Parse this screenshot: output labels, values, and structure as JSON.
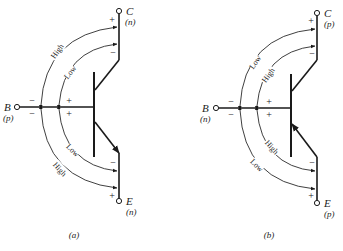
{
  "diagrams": [
    {
      "id": "a",
      "caption": "(a)",
      "type": "npn",
      "terminals": {
        "collector": {
          "letter": "C",
          "type": "(n)"
        },
        "base": {
          "letter": "B",
          "type": "(p)"
        },
        "emitter": {
          "letter": "E",
          "type": "(n)"
        }
      },
      "arcs": {
        "top_outer": "High",
        "top_inner": "Low",
        "bottom_inner": "Low",
        "bottom_outer": "High"
      },
      "signs": {
        "collector_top": "+",
        "collector_bottom": "−",
        "base_left_top": "−",
        "base_left_bottom": "−",
        "base_right_top": "+",
        "base_right_bottom": "+",
        "emitter_top": "−",
        "emitter_bottom": "+"
      }
    },
    {
      "id": "b",
      "caption": "(b)",
      "type": "pnp",
      "terminals": {
        "collector": {
          "letter": "C",
          "type": "(p)"
        },
        "base": {
          "letter": "B",
          "type": "(n)"
        },
        "emitter": {
          "letter": "E",
          "type": "(p)"
        }
      },
      "arcs": {
        "top_outer": "Low",
        "top_inner": "High",
        "bottom_inner": "High",
        "bottom_outer": "Low"
      },
      "signs": {
        "collector_top": "+",
        "collector_bottom": "−",
        "base_left_top": "−",
        "base_left_bottom": "−",
        "base_right_top": "+",
        "base_right_bottom": "+",
        "emitter_top": "−",
        "emitter_bottom": "+"
      }
    }
  ]
}
